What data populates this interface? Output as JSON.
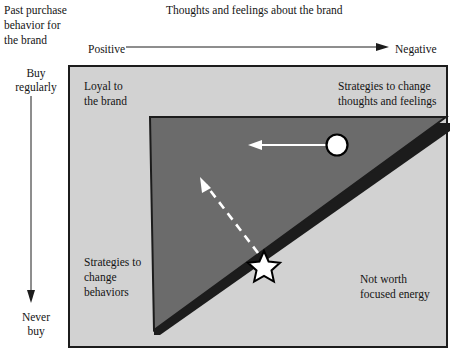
{
  "diagram": {
    "title_x_axis": "Thoughts and feelings about the brand",
    "title_y_axis": "Past purchase\nbehavior for\nthe brand",
    "x_axis": {
      "left_label": "Positive",
      "right_label": "Negative",
      "direction": "left-to-right"
    },
    "y_axis": {
      "top_label": "Buy\nregularly",
      "bottom_label": "Never\nbuy",
      "direction": "top-to-bottom"
    },
    "quadrants": [
      {
        "id": "top-left",
        "label": "Loyal to\nthe brand"
      },
      {
        "id": "top-right",
        "label": "Strategies to change\nthoughts and feelings"
      },
      {
        "id": "bottom-left",
        "label": "Strategies to\nchange\nbehaviors"
      },
      {
        "id": "bottom-right",
        "label": "Not worth\nfocused energy"
      }
    ],
    "markers": [
      {
        "id": "circle-marker",
        "shape": "circle",
        "fill": "#ffffff",
        "stroke": "#000000"
      },
      {
        "id": "star-marker",
        "shape": "star",
        "fill": "#ffffff",
        "stroke": "#000000"
      }
    ],
    "movement_arrows": [
      {
        "id": "solid-arrow",
        "style": "solid",
        "color": "#ffffff",
        "from": "circle-marker",
        "direction": "left"
      },
      {
        "id": "dashed-arrow",
        "style": "dashed",
        "color": "#ffffff",
        "from": "star-marker",
        "direction": "up-left"
      }
    ],
    "colors": {
      "page_background": "#ffffff",
      "matrix_background": "#d2d2d2",
      "triangle_fill": "#6b6b6b",
      "border": "#1c1c1c",
      "text": "#141414",
      "marker_fill": "#ffffff",
      "marker_stroke": "#000000",
      "arrow_white": "#ffffff"
    }
  }
}
